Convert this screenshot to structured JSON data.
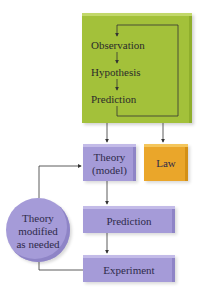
{
  "diagram": {
    "type": "flowchart",
    "title": "",
    "colors": {
      "observation_block": "#a3c13a",
      "theory_blocks": "#a59bd8",
      "law_block": "#eaa62a",
      "connector": "#333333"
    },
    "observation_block": {
      "steps": [
        "Observation",
        "Hypothesis",
        "Prediction"
      ],
      "loop": "Prediction loops back to Observation"
    },
    "theory": {
      "line1": "Theory",
      "line2": "(model)"
    },
    "law": {
      "label": "Law"
    },
    "prediction": {
      "label": "Prediction"
    },
    "experiment": {
      "label": "Experiment"
    },
    "feedback": {
      "line1": "Theory",
      "line2": "modified",
      "line3": "as needed"
    },
    "edges": [
      {
        "from": "Observation block",
        "to": "Theory (model)"
      },
      {
        "from": "Observation block",
        "to": "Law"
      },
      {
        "from": "Theory (model)",
        "to": "Prediction"
      },
      {
        "from": "Prediction",
        "to": "Experiment"
      },
      {
        "from": "Experiment",
        "to": "Theory modified as needed"
      },
      {
        "from": "Theory modified as needed",
        "to": "Theory (model)"
      }
    ]
  }
}
